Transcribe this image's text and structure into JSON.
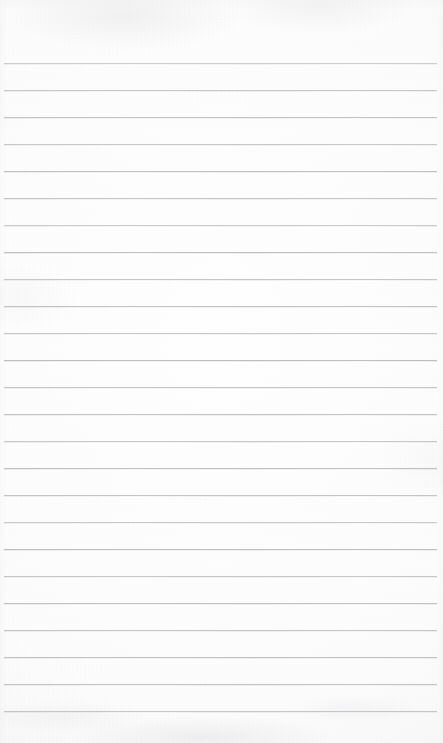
{
  "document": {
    "kind": "scanned-lined-paper",
    "title": "Blank Ruled Notebook Page",
    "page_width": 443,
    "page_height": 743,
    "content_text": "",
    "has_handwriting": false,
    "has_printed_text": false
  },
  "paper": {
    "background_color": "#fbfbfb",
    "edge_shadow_color": "#eceef0",
    "texture": "light scan grain"
  },
  "rules": {
    "line_color": "#b9bbbf",
    "line_thickness_px": 1,
    "first_line_y": 63,
    "line_spacing_px": 27,
    "line_count": 25,
    "left_margin_px": 4,
    "right_margin_px": 6,
    "top_blank_margin_px": 63,
    "bottom_blank_margin_px": 21,
    "y_positions": [
      63,
      90,
      117,
      144,
      171,
      198,
      225,
      252,
      279,
      306,
      333,
      360,
      387,
      414,
      441,
      468,
      495,
      522,
      549,
      576,
      603,
      630,
      657,
      684,
      711
    ],
    "opacities": [
      0.72,
      0.8,
      0.86,
      0.78,
      0.9,
      0.84,
      0.76,
      0.92,
      0.82,
      0.88,
      0.79,
      0.94,
      0.83,
      0.87,
      0.8,
      0.91,
      0.85,
      0.77,
      0.93,
      0.81,
      0.89,
      0.84,
      0.9,
      0.86,
      0.82
    ]
  }
}
